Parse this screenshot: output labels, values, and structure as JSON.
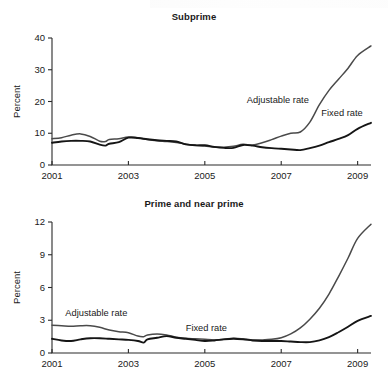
{
  "figure": {
    "panels": [
      {
        "title": "Subprime"
      },
      {
        "title": "Prime and near prime"
      }
    ]
  },
  "chart_data": [
    {
      "type": "line",
      "title": "Subprime",
      "xlabel": "",
      "ylabel": "Percent",
      "xlim": [
        2001.0,
        2009.35
      ],
      "ylim": [
        0,
        40
      ],
      "xticks": [
        2001,
        2003,
        2005,
        2007,
        2009
      ],
      "xtick_labels": [
        "2001",
        "2003",
        "2005",
        "2007",
        "2009"
      ],
      "yticks": [
        0,
        10,
        20,
        30,
        40
      ],
      "ytick_labels": [
        "0",
        "10",
        "20",
        "30",
        "40"
      ],
      "grid": false,
      "legend_position": "inline-annotations",
      "annotations": [
        {
          "text": "Adjustable rate",
          "x": 2006.1,
          "y": 19.5
        },
        {
          "text": "Fixed rate",
          "x": 2008.05,
          "y": 15.3
        }
      ],
      "series": [
        {
          "name": "Adjustable rate",
          "color": "#4a4a4a",
          "x": [
            2001.0,
            2001.25,
            2001.5,
            2001.75,
            2002.0,
            2002.25,
            2002.4,
            2002.5,
            2002.75,
            2003.0,
            2003.25,
            2003.5,
            2003.75,
            2004.0,
            2004.25,
            2004.5,
            2004.75,
            2005.0,
            2005.25,
            2005.5,
            2005.75,
            2006.0,
            2006.25,
            2006.5,
            2006.75,
            2007.0,
            2007.25,
            2007.5,
            2007.75,
            2008.0,
            2008.25,
            2008.5,
            2008.75,
            2009.0,
            2009.35
          ],
          "values": [
            8.3,
            8.6,
            9.4,
            9.8,
            9.0,
            7.5,
            7.4,
            8.0,
            8.3,
            8.8,
            8.6,
            8.0,
            7.6,
            7.4,
            7.1,
            6.6,
            6.2,
            6.0,
            5.6,
            5.6,
            5.9,
            6.5,
            6.3,
            7.0,
            8.0,
            9.1,
            10.0,
            10.4,
            13.5,
            19.0,
            23.5,
            27.0,
            30.5,
            34.5,
            37.5
          ]
        },
        {
          "name": "Fixed rate",
          "color": "#151515",
          "x": [
            2001.0,
            2001.25,
            2001.5,
            2001.75,
            2002.0,
            2002.25,
            2002.4,
            2002.5,
            2002.75,
            2003.0,
            2003.25,
            2003.5,
            2003.75,
            2004.0,
            2004.25,
            2004.5,
            2004.75,
            2005.0,
            2005.25,
            2005.5,
            2005.75,
            2006.0,
            2006.25,
            2006.5,
            2006.75,
            2007.0,
            2007.25,
            2007.5,
            2007.75,
            2008.0,
            2008.25,
            2008.5,
            2008.75,
            2009.0,
            2009.35
          ],
          "values": [
            7.0,
            7.4,
            7.6,
            7.6,
            7.4,
            6.4,
            6.1,
            6.7,
            7.2,
            8.6,
            8.5,
            8.1,
            7.8,
            7.6,
            7.4,
            6.5,
            6.2,
            6.2,
            5.7,
            5.4,
            5.4,
            6.3,
            6.1,
            5.6,
            5.3,
            5.1,
            4.9,
            4.7,
            5.3,
            6.1,
            7.2,
            8.2,
            9.4,
            11.4,
            13.3
          ]
        }
      ]
    },
    {
      "type": "line",
      "title": "Prime and near prime",
      "xlabel": "",
      "ylabel": "Percent",
      "xlim": [
        2001.0,
        2009.35
      ],
      "ylim": [
        0,
        12
      ],
      "xticks": [
        2001,
        2003,
        2005,
        2007,
        2009
      ],
      "xtick_labels": [
        "2001",
        "2003",
        "2005",
        "2007",
        "2009"
      ],
      "yticks": [
        0,
        3,
        6,
        9,
        12
      ],
      "ytick_labels": [
        "0",
        "3",
        "6",
        "9",
        "12"
      ],
      "grid": false,
      "legend_position": "inline-annotations",
      "annotations": [
        {
          "text": "Adjustable rate",
          "x": 2001.35,
          "y": 3.35
        },
        {
          "text": "Fixed rate",
          "x": 2004.5,
          "y": 2.0
        }
      ],
      "series": [
        {
          "name": "Adjustable rate",
          "color": "#4a4a4a",
          "x": [
            2001.0,
            2001.25,
            2001.5,
            2001.75,
            2002.0,
            2002.25,
            2002.5,
            2002.75,
            2003.0,
            2003.25,
            2003.4,
            2003.5,
            2003.75,
            2004.0,
            2004.25,
            2004.5,
            2004.75,
            2005.0,
            2005.25,
            2005.5,
            2005.75,
            2006.0,
            2006.25,
            2006.5,
            2006.75,
            2007.0,
            2007.25,
            2007.5,
            2007.75,
            2008.0,
            2008.25,
            2008.5,
            2008.75,
            2009.0,
            2009.35
          ],
          "values": [
            2.55,
            2.5,
            2.45,
            2.5,
            2.5,
            2.35,
            2.1,
            1.95,
            1.85,
            1.55,
            1.5,
            1.65,
            1.75,
            1.65,
            1.45,
            1.35,
            1.3,
            1.25,
            1.2,
            1.25,
            1.35,
            1.3,
            1.2,
            1.2,
            1.25,
            1.4,
            1.75,
            2.3,
            3.1,
            4.1,
            5.4,
            7.0,
            8.7,
            10.5,
            11.8
          ]
        },
        {
          "name": "Fixed rate",
          "color": "#151515",
          "x": [
            2001.0,
            2001.25,
            2001.5,
            2001.75,
            2002.0,
            2002.25,
            2002.5,
            2002.75,
            2003.0,
            2003.25,
            2003.4,
            2003.5,
            2003.75,
            2004.0,
            2004.25,
            2004.5,
            2004.75,
            2005.0,
            2005.25,
            2005.5,
            2005.75,
            2006.0,
            2006.25,
            2006.5,
            2006.75,
            2007.0,
            2007.25,
            2007.5,
            2007.75,
            2008.0,
            2008.25,
            2008.5,
            2008.75,
            2009.0,
            2009.35
          ],
          "values": [
            1.3,
            1.15,
            1.1,
            1.25,
            1.35,
            1.35,
            1.3,
            1.25,
            1.2,
            1.1,
            0.95,
            1.25,
            1.4,
            1.55,
            1.4,
            1.3,
            1.2,
            1.1,
            1.15,
            1.25,
            1.3,
            1.25,
            1.15,
            1.1,
            1.1,
            1.1,
            1.05,
            1.0,
            1.0,
            1.15,
            1.45,
            1.9,
            2.4,
            2.95,
            3.4
          ]
        }
      ]
    }
  ]
}
